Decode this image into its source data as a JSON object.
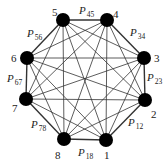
{
  "diagram": {
    "type": "complete-graph",
    "colors": {
      "edge": "#333333",
      "node": "#000000",
      "background": "#ffffff",
      "text": "#222222"
    },
    "nodes": [
      {
        "id": "1",
        "label": "1",
        "x": 106,
        "y": 140,
        "lx": 104,
        "ly": 159
      },
      {
        "id": "2",
        "label": "2",
        "x": 145,
        "y": 100,
        "lx": 151,
        "ly": 118
      },
      {
        "id": "3",
        "label": "3",
        "x": 144,
        "y": 58,
        "lx": 154,
        "ly": 62
      },
      {
        "id": "4",
        "label": "4",
        "x": 107,
        "y": 20,
        "lx": 113,
        "ly": 18
      },
      {
        "id": "5",
        "label": "5",
        "x": 63,
        "y": 20,
        "lx": 52,
        "ly": 16
      },
      {
        "id": "6",
        "label": "6",
        "x": 27,
        "y": 58,
        "lx": 11,
        "ly": 62
      },
      {
        "id": "7",
        "label": "7",
        "x": 26,
        "y": 99,
        "lx": 12,
        "ly": 112
      },
      {
        "id": "8",
        "label": "8",
        "x": 64,
        "y": 139,
        "lx": 55,
        "ly": 159
      }
    ],
    "edge_labels": [
      {
        "main": "P",
        "sub": "45",
        "x": 79,
        "y": 14
      },
      {
        "main": "P",
        "sub": "34",
        "x": 130,
        "y": 36
      },
      {
        "main": "P",
        "sub": "23",
        "x": 147,
        "y": 81
      },
      {
        "main": "P",
        "sub": "12",
        "x": 128,
        "y": 126
      },
      {
        "main": "P",
        "sub": "18",
        "x": 78,
        "y": 156
      },
      {
        "main": "P",
        "sub": "78",
        "x": 31,
        "y": 128
      },
      {
        "main": "P",
        "sub": "67",
        "x": 7,
        "y": 82
      },
      {
        "main": "P",
        "sub": "56",
        "x": 27,
        "y": 37
      }
    ],
    "outer_edges": [
      [
        "1",
        "2"
      ],
      [
        "2",
        "3"
      ],
      [
        "3",
        "4"
      ],
      [
        "4",
        "5"
      ],
      [
        "5",
        "6"
      ],
      [
        "6",
        "7"
      ],
      [
        "7",
        "8"
      ],
      [
        "8",
        "1"
      ]
    ],
    "all_edges": "all pairs (28 edges)"
  }
}
